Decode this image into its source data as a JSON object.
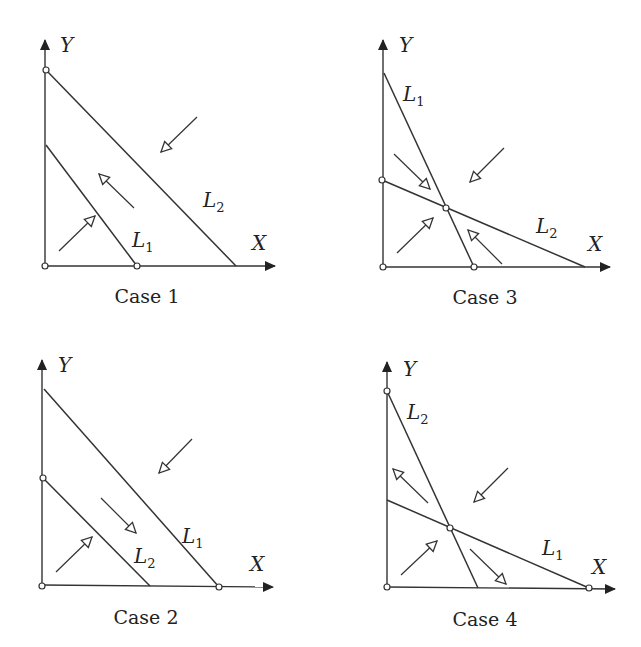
{
  "figure": {
    "panels": [
      {
        "id": "case1",
        "caption": "Case 1",
        "axis_x_label": "X",
        "axis_y_label": "Y",
        "origin": [
          45,
          266
        ],
        "y_axis_top": [
          45,
          40
        ],
        "x_axis_tip": [
          275,
          266
        ],
        "lines": [
          {
            "name": "L",
            "sub": "2",
            "from": [
              46,
              70
            ],
            "to": [
              236,
              266
            ],
            "label_pos": [
              203,
              207
            ]
          },
          {
            "name": "L",
            "sub": "1",
            "from": [
              46,
              145
            ],
            "to": [
              137,
              266
            ],
            "label_pos": [
              132,
              247
            ]
          }
        ],
        "dots": [
          [
            46,
            70
          ],
          [
            137,
            266
          ],
          [
            45,
            266
          ]
        ],
        "arrows": [
          {
            "from": [
              197,
              117
            ],
            "to": [
              161,
              152
            ]
          },
          {
            "from": [
              134,
              208
            ],
            "to": [
              99,
              174
            ]
          },
          {
            "from": [
              59,
              251
            ],
            "to": [
              95,
              216
            ]
          }
        ],
        "x_label_pos": [
          252,
          250
        ],
        "y_label_pos": [
          60,
          52
        ],
        "caption_pos": [
          147,
          303
        ]
      },
      {
        "id": "case3",
        "caption": "Case 3",
        "axis_x_label": "X",
        "axis_y_label": "Y",
        "origin": [
          383,
          267
        ],
        "y_axis_top": [
          383,
          40
        ],
        "x_axis_tip": [
          610,
          267
        ],
        "lines": [
          {
            "name": "L",
            "sub": "1",
            "from": [
              384,
              73
            ],
            "to": [
              474,
              267
            ],
            "label_pos": [
              403,
              101
            ]
          },
          {
            "name": "L",
            "sub": "2",
            "from": [
              382,
              180
            ],
            "to": [
              585,
              267
            ],
            "label_pos": [
              536,
              233
            ]
          }
        ],
        "dots": [
          [
            382,
            180
          ],
          [
            474,
            267
          ],
          [
            446,
            208
          ],
          [
            383,
            267
          ]
        ],
        "arrows": [
          {
            "from": [
              394,
              154
            ],
            "to": [
              430,
              189
            ]
          },
          {
            "from": [
              504,
              148
            ],
            "to": [
              470,
              182
            ]
          },
          {
            "from": [
              397,
              253
            ],
            "to": [
              433,
              218
            ]
          },
          {
            "from": [
              502,
              264
            ],
            "to": [
              468,
              230
            ]
          }
        ],
        "x_label_pos": [
          588,
          251
        ],
        "y_label_pos": [
          399,
          52
        ],
        "caption_pos": [
          485,
          304
        ]
      },
      {
        "id": "case2",
        "caption": "Case 2",
        "axis_x_label": "X",
        "axis_y_label": "Y",
        "origin": [
          42,
          585
        ],
        "y_axis_top": [
          42,
          360
        ],
        "x_axis_tip": [
          273,
          587
        ],
        "lines": [
          {
            "name": "L",
            "sub": "1",
            "from": [
              44,
              389
            ],
            "to": [
              219,
              587
            ],
            "label_pos": [
              182,
              543
            ]
          },
          {
            "name": "L",
            "sub": "2",
            "from": [
              43,
              478
            ],
            "to": [
              150,
              586
            ],
            "label_pos": [
              134,
              563
            ]
          }
        ],
        "dots": [
          [
            43,
            478
          ],
          [
            219,
            587
          ],
          [
            42,
            586
          ]
        ],
        "arrows": [
          {
            "from": [
              192,
              439
            ],
            "to": [
              159,
              473
            ]
          },
          {
            "from": [
              101,
              498
            ],
            "to": [
              136,
              533
            ]
          },
          {
            "from": [
              56,
              572
            ],
            "to": [
              92,
              537
            ]
          }
        ],
        "x_label_pos": [
          250,
          571
        ],
        "y_label_pos": [
          58,
          372
        ],
        "caption_pos": [
          146,
          624
        ]
      },
      {
        "id": "case4",
        "caption": "Case 4",
        "axis_x_label": "X",
        "axis_y_label": "Y",
        "origin": [
          387,
          587
        ],
        "y_axis_top": [
          387,
          362
        ],
        "x_axis_tip": [
          615,
          589
        ],
        "lines": [
          {
            "name": "L",
            "sub": "2",
            "from": [
              387,
              391
            ],
            "to": [
              478,
              588
            ],
            "label_pos": [
              407,
              419
            ]
          },
          {
            "name": "L",
            "sub": "1",
            "from": [
              387,
              500
            ],
            "to": [
              589,
              588
            ],
            "label_pos": [
              542,
              555
            ]
          }
        ],
        "dots": [
          [
            387,
            391
          ],
          [
            589,
            588
          ],
          [
            450,
            528
          ],
          [
            387,
            587
          ]
        ],
        "arrows": [
          {
            "from": [
              428,
              503
            ],
            "to": [
              393,
              469
            ]
          },
          {
            "from": [
              508,
              468
            ],
            "to": [
              474,
              502
            ]
          },
          {
            "from": [
              401,
              575
            ],
            "to": [
              437,
              541
            ]
          },
          {
            "from": [
              470,
              549
            ],
            "to": [
              506,
              584
            ]
          }
        ],
        "x_label_pos": [
          592,
          574
        ],
        "y_label_pos": [
          403,
          376
        ],
        "caption_pos": [
          485,
          626
        ]
      }
    ]
  }
}
